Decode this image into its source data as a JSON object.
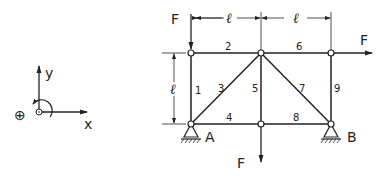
{
  "coordinate_system": {
    "x_label": "x",
    "y_label": "y",
    "rotation_symbol": "⊕"
  },
  "truss": {
    "dimensions": {
      "horizontal_1": "ℓ",
      "horizontal_2": "ℓ",
      "vertical": "ℓ"
    },
    "members": [
      {
        "id": "1"
      },
      {
        "id": "2"
      },
      {
        "id": "3"
      },
      {
        "id": "4"
      },
      {
        "id": "5"
      },
      {
        "id": "6"
      },
      {
        "id": "7"
      },
      {
        "id": "8"
      },
      {
        "id": "9"
      }
    ],
    "supports": {
      "A": "A",
      "B": "B"
    },
    "loads": {
      "top_left_down": "F",
      "top_right_horizontal": "F",
      "bottom_middle_down": "F"
    }
  }
}
